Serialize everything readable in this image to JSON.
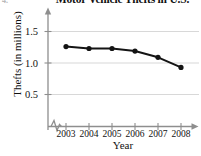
{
  "figure": {
    "label": "4.",
    "title": "Motor Vehicle Thefts in U.S."
  },
  "chart_data": {
    "type": "line",
    "title": "Motor Vehicle Thefts in U.S.",
    "xlabel": "Year",
    "ylabel": "Thefts (in millions)",
    "categories": [
      "2003",
      "2004",
      "2005",
      "2006",
      "2007",
      "2008"
    ],
    "x": [
      2003,
      2004,
      2005,
      2006,
      2007,
      2008
    ],
    "values": [
      1.26,
      1.23,
      1.23,
      1.19,
      1.09,
      0.93
    ],
    "series": [
      {
        "name": "Thefts (in millions)",
        "values": [
          1.26,
          1.23,
          1.23,
          1.19,
          1.09,
          0.93
        ]
      }
    ],
    "ytick_labels": [
      "0.5",
      "1.0",
      "1.5"
    ],
    "yticks": [
      0.5,
      1.0,
      1.5
    ],
    "ylim": [
      0.0,
      1.72
    ],
    "xlim": [
      2002.5,
      2008.7
    ],
    "grid": "horizontal",
    "legend": "none",
    "axis_break": true,
    "marker": "filled-circle",
    "line_color": "#141414",
    "grid_color": "#d8d8d8",
    "axis_color": "#8e8e8e",
    "background": "#ffffff"
  }
}
